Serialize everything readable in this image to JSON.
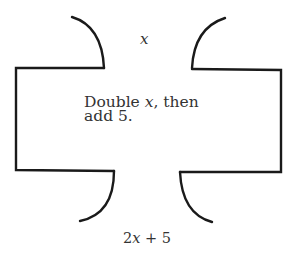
{
  "diagram": {
    "type": "function-machine",
    "input_label": "x",
    "rule": {
      "line1": "Double x, then",
      "line2": "add 5."
    },
    "output": {
      "coef": "2",
      "var": "x",
      "rest": " + 5"
    },
    "stroke_color": "#1a1a1a",
    "text_color": "#333333"
  }
}
